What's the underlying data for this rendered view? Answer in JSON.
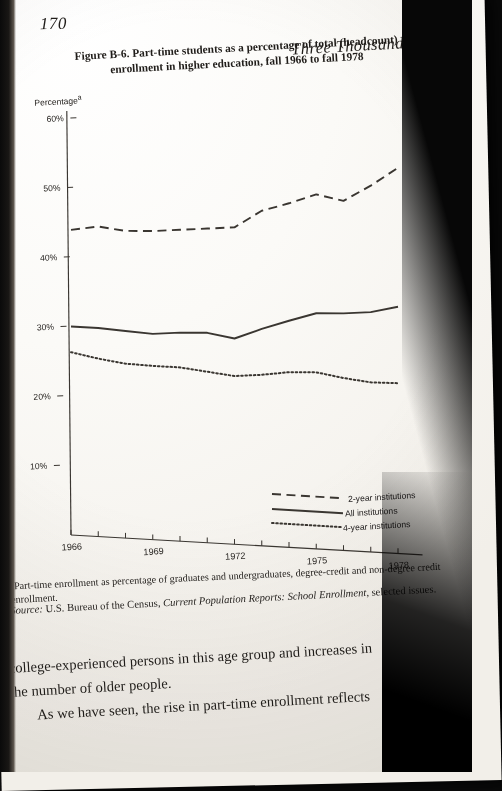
{
  "page": {
    "number": "170",
    "running_head": "Three Thousand Futures"
  },
  "figure": {
    "caption": "Figure B-6. Part-time students as a percentage of total (headcount) enrollment in higher education, fall 1966 to fall 1978",
    "y_axis_title": "Percentage",
    "y_axis_title_marker": "a",
    "footnote_marker": "a",
    "footnote": "Part-time enrollment as percentage of graduates and undergraduates, degree-credit and non-degree credit enrollment.",
    "source_label": "Source:",
    "source_text_1": "U.S. Bureau of the Census, ",
    "source_text_italic": "Current Population Reports: School Enrollment,",
    "source_text_2": " selected issues."
  },
  "chart_data": {
    "type": "line",
    "title": "Part-time students as a percentage of total (headcount) enrollment in higher education, fall 1966 to fall 1978",
    "xlabel": "",
    "ylabel": "Percentage",
    "xlim": [
      1966,
      1978
    ],
    "ylim": [
      0,
      60
    ],
    "grid": false,
    "legend_position": "bottom-right",
    "x": [
      1966,
      1967,
      1968,
      1969,
      1970,
      1971,
      1972,
      1973,
      1974,
      1975,
      1976,
      1977,
      1978
    ],
    "x_tick_labels": [
      "1966",
      "1969",
      "1972",
      "1975",
      "1978"
    ],
    "x_ticks": [
      1966,
      1969,
      1972,
      1975,
      1978
    ],
    "y_tick_labels": [
      "10%",
      "20%",
      "30%",
      "40%",
      "50%",
      "60%"
    ],
    "y_ticks": [
      10,
      20,
      30,
      40,
      50,
      60
    ],
    "series": [
      {
        "name": "2-year institutions",
        "style": "dashed",
        "values": [
          43.9,
          44.6,
          44.2,
          44.4,
          44.8,
          45.2,
          45.6,
          48.2,
          49.5,
          51.0,
          50.3,
          52.7,
          55.5
        ]
      },
      {
        "name": "All institutions",
        "style": "solid",
        "values": [
          30.0,
          30.0,
          29.8,
          29.6,
          30.0,
          30.2,
          29.6,
          31.2,
          32.6,
          33.9,
          34.1,
          34.5,
          35.5
        ]
      },
      {
        "name": "4-year institutions",
        "style": "dotted",
        "values": [
          26.3,
          25.6,
          25.1,
          25.0,
          25.0,
          24.6,
          24.2,
          24.6,
          25.2,
          25.4,
          24.8,
          24.4,
          24.5
        ]
      }
    ]
  },
  "legend": {
    "two_year": "2-year institutions",
    "all": "All institutions",
    "four_year": "4-year institutions"
  },
  "body": {
    "line1": "college-experienced persons in this age group and increases in",
    "line2": "the number of older people.",
    "line3": "As we have seen, the rise in part-time enrollment reflects"
  },
  "colors": {
    "ink": "#201d1a",
    "line": "#3a3631",
    "paper": "#fbfaf7"
  }
}
